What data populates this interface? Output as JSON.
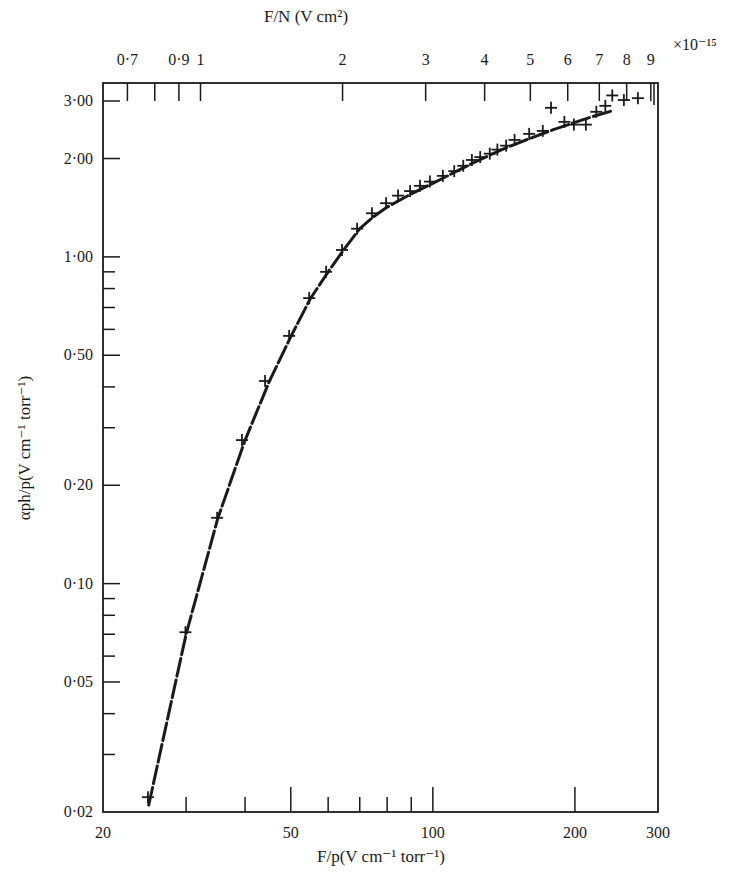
{
  "chart_data": {
    "type": "scatter",
    "title": "",
    "xscale": "log",
    "yscale": "log",
    "xlabel": "F/p(V cm⁻¹ torr⁻¹)",
    "ylabel": "αph/p(V cm⁻¹ torr⁻¹)",
    "top_xlabel": "F/N (V cm²)",
    "xlim": [
      20,
      300
    ],
    "ylim": [
      0.02,
      3.0
    ],
    "grid": false,
    "legend": "none",
    "x_ticks": [
      {
        "value": 20,
        "label": "20"
      },
      {
        "value": 30,
        "label": ""
      },
      {
        "value": 40,
        "label": ""
      },
      {
        "value": 50,
        "label": "50"
      },
      {
        "value": 60,
        "label": ""
      },
      {
        "value": 70,
        "label": ""
      },
      {
        "value": 80,
        "label": ""
      },
      {
        "value": 90,
        "label": ""
      },
      {
        "value": 100,
        "label": "100"
      },
      {
        "value": 200,
        "label": "200"
      },
      {
        "value": 300,
        "label": "300"
      }
    ],
    "top_x_ticks": [
      {
        "value": 0.7,
        "label": "0·7"
      },
      {
        "value": 0.8,
        "label": ""
      },
      {
        "value": 0.9,
        "label": "0·9"
      },
      {
        "value": 1,
        "label": "1"
      },
      {
        "value": 2,
        "label": "2"
      },
      {
        "value": 3,
        "label": "3"
      },
      {
        "value": 4,
        "label": "4"
      },
      {
        "value": 5,
        "label": "5"
      },
      {
        "value": 6,
        "label": "6"
      },
      {
        "value": 7,
        "label": "7"
      },
      {
        "value": 8,
        "label": "8"
      },
      {
        "value": 9,
        "label": "9"
      }
    ],
    "top_x_multiplier": "×10⁻¹⁵",
    "top_x_factor_fn_of_bottom": 3.107e-17,
    "y_ticks": [
      {
        "value": 0.02,
        "label": "0·02"
      },
      {
        "value": 0.03,
        "label": ""
      },
      {
        "value": 0.04,
        "label": ""
      },
      {
        "value": 0.05,
        "label": "0·05"
      },
      {
        "value": 0.06,
        "label": ""
      },
      {
        "value": 0.07,
        "label": ""
      },
      {
        "value": 0.08,
        "label": ""
      },
      {
        "value": 0.09,
        "label": ""
      },
      {
        "value": 0.1,
        "label": "0·10"
      },
      {
        "value": 0.2,
        "label": "0·20"
      },
      {
        "value": 0.3,
        "label": ""
      },
      {
        "value": 0.4,
        "label": ""
      },
      {
        "value": 0.5,
        "label": "0·50"
      },
      {
        "value": 0.6,
        "label": ""
      },
      {
        "value": 0.7,
        "label": ""
      },
      {
        "value": 0.8,
        "label": ""
      },
      {
        "value": 0.9,
        "label": ""
      },
      {
        "value": 1.0,
        "label": "1·00"
      },
      {
        "value": 2.0,
        "label": "2·00"
      },
      {
        "value": 3.0,
        "label": "3·00"
      }
    ],
    "series": [
      {
        "name": "measured",
        "marker": "plus",
        "x": [
          24.9,
          29.9,
          34.9,
          39.4,
          44.1,
          49.6,
          54.7,
          59.4,
          64.2,
          69.1,
          74.3,
          79.6,
          84.4,
          89.5,
          93.9,
          98.6,
          105,
          111,
          116,
          121,
          126,
          132,
          137,
          143,
          149,
          160,
          171,
          178,
          190,
          199,
          211,
          222,
          232,
          240,
          254,
          272
        ],
        "y": [
          0.0222,
          0.071,
          0.159,
          0.275,
          0.417,
          0.573,
          0.748,
          0.9,
          1.05,
          1.22,
          1.36,
          1.46,
          1.54,
          1.59,
          1.65,
          1.7,
          1.77,
          1.83,
          1.9,
          1.98,
          2.02,
          2.07,
          2.13,
          2.19,
          2.28,
          2.38,
          2.43,
          2.86,
          2.59,
          2.54,
          2.54,
          2.78,
          2.9,
          3.12,
          3.02,
          3.06
        ]
      },
      {
        "name": "fitted-curve",
        "marker": "none",
        "style": "dashed-solid",
        "x": [
          25,
          30,
          35,
          40,
          45,
          50,
          55,
          60,
          65,
          70,
          75,
          80,
          90,
          100,
          120,
          140,
          160,
          180,
          200,
          220,
          240
        ],
        "y": [
          0.021,
          0.07,
          0.158,
          0.275,
          0.415,
          0.57,
          0.745,
          0.9,
          1.06,
          1.22,
          1.33,
          1.42,
          1.56,
          1.68,
          1.92,
          2.13,
          2.3,
          2.45,
          2.58,
          2.7,
          2.8
        ]
      }
    ]
  }
}
